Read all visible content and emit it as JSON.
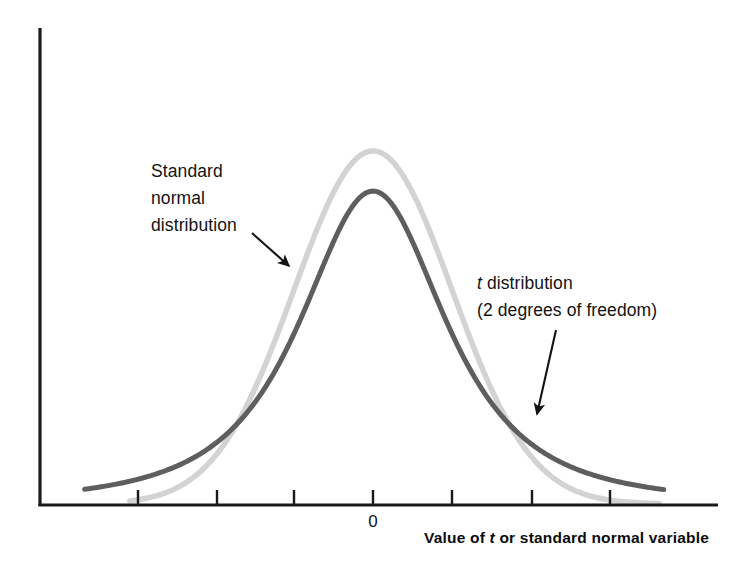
{
  "figure": {
    "background_color": "#ffffff",
    "axis_color": "#1a1a1a"
  },
  "annotations": {
    "normal": {
      "line1": "Standard",
      "line2": "normal",
      "line3": "distribution",
      "arrow_from": [
        252,
        233
      ],
      "arrow_to": [
        289,
        266
      ]
    },
    "t": {
      "line1_italic": "t",
      "line1_rest": " distribution",
      "line2": "(2 degrees of freedom)",
      "arrow_from": [
        556,
        330
      ],
      "arrow_to": [
        537,
        414
      ]
    }
  },
  "axis": {
    "x_title_prefix": "Value of ",
    "x_title_italic": "t",
    "x_title_suffix": " or standard normal variable",
    "tick_labels": [
      "0"
    ],
    "tick_positions_px": [
      45,
      138,
      217,
      294,
      373,
      452,
      532,
      610
    ],
    "zero_tick_px": 373
  },
  "chart_data": {
    "type": "line",
    "title": "",
    "xlabel": "Value of t or standard normal variable",
    "ylabel": "",
    "xlim": [
      -4.2,
      4.2
    ],
    "ylim": [
      0,
      0.42
    ],
    "grid": false,
    "legend": "annotation-arrows",
    "x_tick_values": [
      -4,
      -3,
      -2,
      -1,
      0,
      1,
      2,
      3
    ],
    "x_labeled_ticks": {
      "0": 0
    },
    "series": [
      {
        "name": "Standard normal distribution",
        "color": "#d3d3d3",
        "line_width": 5,
        "formula": "phi(x) = (1/sqrt(2*pi)) * exp(-x^2/2)",
        "x": [
          -4.0,
          -3.5,
          -3.0,
          -2.5,
          -2.0,
          -1.5,
          -1.0,
          -0.5,
          0.0,
          0.5,
          1.0,
          1.5,
          2.0,
          2.5,
          3.0,
          3.5,
          4.0
        ],
        "y": [
          0.0001,
          0.0009,
          0.0044,
          0.0175,
          0.054,
          0.1295,
          0.242,
          0.3521,
          0.3989,
          0.3521,
          0.242,
          0.1295,
          0.054,
          0.0175,
          0.0044,
          0.0009,
          0.0001
        ]
      },
      {
        "name": "t distribution (2 degrees of freedom)",
        "color": "#5e5e5e",
        "line_width": 5,
        "degrees_of_freedom": 2,
        "formula": "f(x) = 1 / (2*sqrt(2)) * (1 + x^2/2)^(-3/2)",
        "x": [
          -4.0,
          -3.5,
          -3.0,
          -2.5,
          -2.0,
          -1.5,
          -1.0,
          -0.5,
          0.0,
          0.5,
          1.0,
          1.5,
          2.0,
          2.5,
          3.0,
          3.5,
          4.0
        ],
        "y": [
          0.0132,
          0.0186,
          0.0274,
          0.0422,
          0.068,
          0.1125,
          0.1925,
          0.3,
          0.3536,
          0.3,
          0.1925,
          0.1125,
          0.068,
          0.0422,
          0.0274,
          0.0186,
          0.0132
        ]
      }
    ]
  }
}
